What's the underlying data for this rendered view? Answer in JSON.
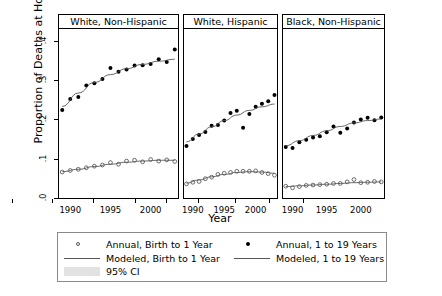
{
  "chart_data": {
    "type": "scatter",
    "title": "",
    "xlabel": "Year",
    "ylabel": "Proportion of Deaths at Home",
    "xlim": [
      1988.6,
      2003.4
    ],
    "ylim": [
      0,
      0.43
    ],
    "xticks": [
      1990,
      1995,
      2000
    ],
    "xticklabels": [
      "1990",
      "1995",
      "2000"
    ],
    "yticks": [
      0,
      0.1,
      0.2,
      0.3,
      0.4
    ],
    "yticklabels": [
      ".0",
      ".1",
      ".2",
      ".3",
      ".4"
    ],
    "grid": false,
    "legend_position": "bottom",
    "panels": [
      {
        "label": "White, Non-Hispanic",
        "series": [
          {
            "name": "Annual, 1 to 19 Years",
            "marker": "filled-circle",
            "x": [
              1989,
              1990,
              1991,
              1992,
              1993,
              1994,
              1995,
              1996,
              1997,
              1998,
              1999,
              2000,
              2001,
              2002,
              2003
            ],
            "values": [
              0.224,
              0.252,
              0.257,
              0.286,
              0.292,
              0.303,
              0.331,
              0.321,
              0.327,
              0.337,
              0.338,
              0.341,
              0.353,
              0.346,
              0.378
            ]
          },
          {
            "name": "Modeled, 1 to 19 Years",
            "type": "line",
            "x": [
              1989,
              1991,
              1993,
              1995,
              1997,
              1999,
              2001,
              2003
            ],
            "values": [
              0.233,
              0.267,
              0.294,
              0.314,
              0.329,
              0.34,
              0.348,
              0.353
            ]
          },
          {
            "name": "Annual, Birth to 1 Year",
            "marker": "open-circle",
            "x": [
              1989,
              1990,
              1991,
              1992,
              1993,
              1994,
              1995,
              1996,
              1997,
              1998,
              1999,
              2000,
              2001,
              2002,
              2003
            ],
            "values": [
              0.066,
              0.07,
              0.073,
              0.077,
              0.081,
              0.084,
              0.09,
              0.086,
              0.094,
              0.096,
              0.092,
              0.098,
              0.094,
              0.097,
              0.093
            ]
          },
          {
            "name": "Modeled, Birth to 1 Year",
            "type": "line",
            "x": [
              1989,
              1991,
              1993,
              1995,
              1997,
              1999,
              2001,
              2003
            ],
            "values": [
              0.067,
              0.073,
              0.08,
              0.086,
              0.091,
              0.094,
              0.096,
              0.096
            ]
          }
        ]
      },
      {
        "label": "White, Hispanic",
        "series": [
          {
            "name": "Annual, 1 to 19 Years",
            "marker": "filled-circle",
            "x": [
              1989,
              1990,
              1991,
              1992,
              1993,
              1994,
              1995,
              1996,
              1997,
              1998,
              1999,
              2000,
              2001,
              2002,
              2003
            ],
            "values": [
              0.132,
              0.15,
              0.16,
              0.168,
              0.184,
              0.186,
              0.197,
              0.216,
              0.222,
              0.179,
              0.214,
              0.232,
              0.24,
              0.246,
              0.262
            ]
          },
          {
            "name": "Modeled, 1 to 19 Years",
            "type": "line",
            "x": [
              1989,
              1991,
              1993,
              1995,
              1997,
              1999,
              2001,
              2003
            ],
            "values": [
              0.143,
              0.163,
              0.181,
              0.197,
              0.211,
              0.223,
              0.232,
              0.239
            ]
          },
          {
            "name": "Annual, Birth to 1 Year",
            "marker": "open-circle",
            "x": [
              1989,
              1990,
              1991,
              1992,
              1993,
              1994,
              1995,
              1996,
              1997,
              1998,
              1999,
              2000,
              2001,
              2002,
              2003
            ],
            "values": [
              0.036,
              0.04,
              0.042,
              0.049,
              0.053,
              0.06,
              0.063,
              0.065,
              0.068,
              0.068,
              0.068,
              0.069,
              0.065,
              0.062,
              0.058
            ]
          },
          {
            "name": "Modeled, Birth to 1 Year",
            "type": "line",
            "x": [
              1989,
              1991,
              1993,
              1995,
              1997,
              1999,
              2001,
              2003
            ],
            "values": [
              0.038,
              0.046,
              0.054,
              0.06,
              0.065,
              0.067,
              0.066,
              0.063
            ]
          }
        ]
      },
      {
        "label": "Black, Non-Hispanic",
        "series": [
          {
            "name": "Annual, 1 to 19 Years",
            "marker": "filled-circle",
            "x": [
              1989,
              1990,
              1991,
              1992,
              1993,
              1994,
              1995,
              1996,
              1997,
              1998,
              1999,
              2000,
              2001,
              2002,
              2003
            ],
            "values": [
              0.13,
              0.127,
              0.142,
              0.148,
              0.154,
              0.157,
              0.167,
              0.182,
              0.166,
              0.177,
              0.192,
              0.2,
              0.204,
              0.198,
              0.205
            ]
          },
          {
            "name": "Modeled, 1 to 19 Years",
            "type": "line",
            "x": [
              1989,
              1991,
              1993,
              1995,
              1997,
              1999,
              2001,
              2003
            ],
            "values": [
              0.133,
              0.146,
              0.159,
              0.171,
              0.182,
              0.191,
              0.197,
              0.201
            ]
          },
          {
            "name": "Annual, Birth to 1 Year",
            "marker": "open-circle",
            "x": [
              1989,
              1990,
              1991,
              1992,
              1993,
              1994,
              1995,
              1996,
              1997,
              1998,
              1999,
              2000,
              2001,
              2002,
              2003
            ],
            "values": [
              0.03,
              0.026,
              0.029,
              0.032,
              0.033,
              0.034,
              0.035,
              0.037,
              0.037,
              0.041,
              0.047,
              0.039,
              0.04,
              0.042,
              0.041
            ]
          },
          {
            "name": "Modeled, Birth to 1 Year",
            "type": "line",
            "x": [
              1989,
              1991,
              1993,
              1995,
              1997,
              1999,
              2001,
              2003
            ],
            "values": [
              0.029,
              0.031,
              0.033,
              0.035,
              0.037,
              0.039,
              0.04,
              0.041
            ]
          }
        ]
      }
    ],
    "legend": [
      {
        "key": "annual-birth",
        "marker": "open-circle",
        "label": "Annual, Birth to 1 Year"
      },
      {
        "key": "annual-1to19",
        "marker": "filled-circle",
        "label": "Annual, 1 to 19 Years"
      },
      {
        "key": "modeled-birth",
        "marker": "line",
        "label": "Modeled, Birth to 1 Year"
      },
      {
        "key": "modeled-1to19",
        "marker": "line",
        "label": "Modeled, 1 to 19 Years"
      },
      {
        "key": "ci",
        "marker": "band",
        "label": "95% CI"
      }
    ],
    "colors": {
      "point": "#000000",
      "line": "#555555",
      "band": "#e2e2e2",
      "axis": "#000000",
      "strip_border": "#000000"
    }
  }
}
